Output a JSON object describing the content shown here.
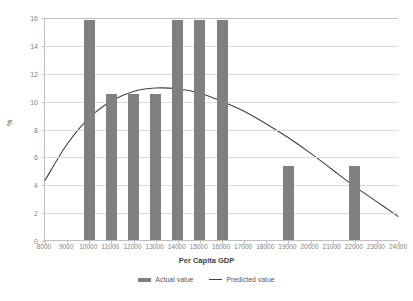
{
  "chart_data": {
    "type": "bar",
    "title": "",
    "xlabel": "Per Capita GDP",
    "ylabel": "%",
    "xlim": [
      8000,
      24000
    ],
    "ylim": [
      0,
      16
    ],
    "grid": true,
    "legend_position": "bottom",
    "x_ticks": [
      8000,
      9000,
      10000,
      11000,
      12000,
      13000,
      14000,
      15000,
      16000,
      17000,
      18000,
      19000,
      20000,
      21000,
      22000,
      23000,
      24000
    ],
    "x_tick_labels": [
      "8000",
      "9000",
      "10000",
      "11000",
      "12000",
      "13000",
      "14000",
      "15000",
      "16000",
      "17000",
      "18000",
      "19000",
      "20000",
      "21000",
      "22000",
      "23000",
      "24000"
    ],
    "y_ticks": [
      0,
      2,
      4,
      6,
      8,
      10,
      12,
      14,
      16
    ],
    "y_tick_labels": [
      "0",
      "2",
      "4",
      "6",
      "8",
      "10",
      "12",
      "14",
      "16"
    ],
    "series": [
      {
        "name": "Actual value",
        "type": "bar",
        "color": "#808080",
        "x": [
          10000,
          11000,
          12000,
          13000,
          14000,
          15000,
          16000,
          19000,
          22000
        ],
        "values": [
          15.8,
          10.5,
          10.5,
          10.5,
          15.8,
          15.8,
          15.8,
          5.3,
          5.3
        ]
      },
      {
        "name": "Predicted value",
        "type": "line",
        "color": "#404040",
        "x": [
          8000,
          9000,
          10000,
          11000,
          12000,
          13000,
          14000,
          15000,
          16000,
          17000,
          18000,
          19000,
          20000,
          21000,
          22000,
          23000,
          24000
        ],
        "values": [
          4.3,
          6.9,
          8.8,
          10.0,
          10.7,
          10.95,
          10.9,
          10.6,
          10.0,
          9.3,
          8.4,
          7.4,
          6.3,
          5.1,
          3.9,
          2.8,
          1.7
        ]
      }
    ]
  },
  "legend": {
    "items": [
      {
        "label": "Actual value",
        "marker": "bar-swatch-icon"
      },
      {
        "label": "Predicted value",
        "marker": "line-swatch-icon"
      }
    ]
  },
  "axes": {
    "x_title": "Per Capita GDP",
    "y_title": "%"
  }
}
